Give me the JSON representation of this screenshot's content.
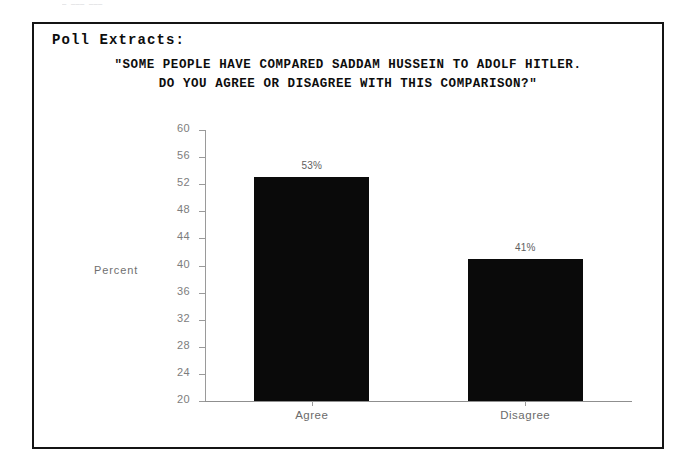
{
  "scan": {
    "top_bleed_text": "—  ——— ———"
  },
  "document": {
    "section_heading": "Poll Extracts:",
    "question_line_1": "\"SOME PEOPLE HAVE COMPARED SADDAM HUSSEIN TO ADOLF HITLER.",
    "question_line_2": "DO YOU AGREE OR DISAGREE WITH THIS COMPARISON?\""
  },
  "chart_data": {
    "type": "bar",
    "title": "\"SOME PEOPLE HAVE COMPARED SADDAM HUSSEIN TO ADOLF HITLER. DO YOU AGREE OR DISAGREE WITH THIS COMPARISON?\"",
    "categories": [
      "Agree",
      "Disagree"
    ],
    "values": [
      53,
      41
    ],
    "value_labels": [
      "53%",
      "41%"
    ],
    "xlabel": "",
    "ylabel": "Percent",
    "ylim": [
      20,
      60
    ],
    "ytick_step": 4,
    "yticks": [
      60,
      56,
      52,
      48,
      44,
      40,
      36,
      32,
      28,
      24,
      20
    ],
    "ytick_labels": [
      "60",
      "56",
      "52",
      "48",
      "44",
      "40",
      "36",
      "32",
      "28",
      "24",
      "20"
    ],
    "grid": false,
    "legend": false,
    "bar_color": "#0a0a0a",
    "axis_color": "#9a9a9a",
    "tick_label_color": "#7d7d7d"
  }
}
